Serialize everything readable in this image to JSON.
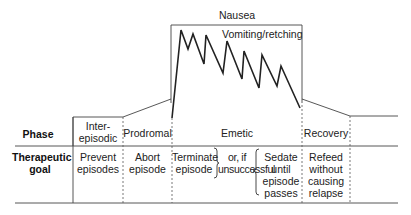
{
  "diagram": {
    "top_label": "Nausea",
    "curve_label": "Vomiting/retching",
    "row_headers": {
      "phase": "Phase",
      "goal": "Therapeutic\ngoal"
    },
    "phases": [
      {
        "name": "Inter-\nepisodic",
        "goal": "Prevent\nepisodes"
      },
      {
        "name": "Prodromal",
        "goal": "Abort\nepisode"
      },
      {
        "name": "Emetic",
        "goal": "Terminate\nepisode",
        "connector": "or, if\nunsuccessful",
        "alt_goal": "Sedate\nuntil\nepisode\npasses"
      },
      {
        "name": "Recovery",
        "goal": "Refeed\nwithout\ncausing\nrelapse"
      }
    ],
    "colors": {
      "line": "#333333",
      "text": "#222222",
      "dashed": "#555555"
    }
  }
}
